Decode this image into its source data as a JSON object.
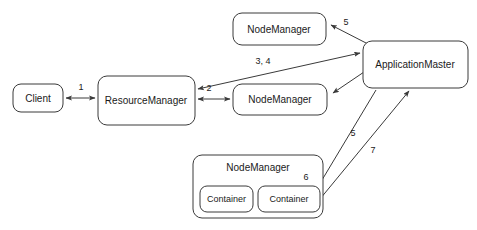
{
  "diagram": {
    "background_color": "#ffffff",
    "stroke_color": "#3a3a3a",
    "text_color": "#1a1a1a",
    "nodes": [
      {
        "id": "client",
        "label": "Client",
        "x": 13,
        "y": 84,
        "w": 50,
        "h": 28
      },
      {
        "id": "resourcemanager",
        "label": "ResourceManager",
        "x": 98,
        "y": 76,
        "w": 97,
        "h": 49
      },
      {
        "id": "nodemanager-top",
        "label": "NodeManager",
        "x": 233,
        "y": 13,
        "w": 93,
        "h": 32
      },
      {
        "id": "nodemanager-mid",
        "label": "NodeManager",
        "x": 233,
        "y": 84,
        "w": 94,
        "h": 31
      },
      {
        "id": "applicationmaster",
        "label": "ApplicationMaster",
        "x": 363,
        "y": 41,
        "w": 105,
        "h": 47
      },
      {
        "id": "nodemanager-bottom",
        "label": "NodeManager",
        "x": 193,
        "y": 155,
        "w": 130,
        "h": 63
      },
      {
        "id": "container-left",
        "label": "Container",
        "x": 200,
        "y": 186,
        "w": 53,
        "h": 26
      },
      {
        "id": "container-right",
        "label": "Container",
        "x": 258,
        "y": 186,
        "w": 62,
        "h": 26
      }
    ],
    "edges": [
      {
        "id": "edge-client-rm",
        "label": "1",
        "label_x": 81,
        "label_y": 88,
        "arrows": "both"
      },
      {
        "id": "edge-rm-nm-mid",
        "label": "2",
        "label_x": 209,
        "label_y": 89,
        "arrows": "both"
      },
      {
        "id": "edge-rm-am",
        "label": "3, 4",
        "label_x": 263,
        "label_y": 62,
        "arrows": "both"
      },
      {
        "id": "edge-am-nm-top",
        "label": "5",
        "label_x": 346,
        "label_y": 23,
        "arrows": "single"
      },
      {
        "id": "edge-am-nm-mid",
        "label": "",
        "label_x": 0,
        "label_y": 0,
        "arrows": "single"
      },
      {
        "id": "edge-am-container",
        "label": "5",
        "label_x": 353,
        "label_y": 134,
        "arrows": "single"
      },
      {
        "id": "edge-container-am",
        "label": "7",
        "label_x": 373,
        "label_y": 151,
        "arrows": "single"
      },
      {
        "id": "edge-container-mark",
        "label": "6",
        "label_x": 306,
        "label_y": 178,
        "arrows": "none"
      }
    ]
  }
}
